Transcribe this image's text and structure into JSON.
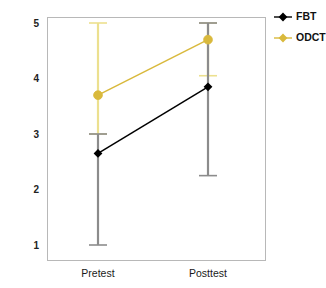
{
  "chart_data": {
    "type": "line",
    "title": "",
    "subtitle": "",
    "xlabel": "",
    "ylabel": "",
    "categories": [
      "Pretest",
      "Posttest"
    ],
    "x": [
      0,
      1
    ],
    "ylim": [
      1,
      5
    ],
    "yticks": [
      1,
      2,
      3,
      4,
      5
    ],
    "ytick_labels": [
      "1",
      "2",
      "3",
      "4",
      "5"
    ],
    "xtick_labels": [
      "Pretest",
      "Posttest"
    ],
    "grid": false,
    "legend_position": "right-top",
    "error_bars": true,
    "error_bar_style": "capped-range",
    "series": [
      {
        "name": "FBT",
        "color": "#000000",
        "marker": "diamond-filled",
        "values": [
          2.65,
          3.85
        ],
        "err_low": [
          1.0,
          2.25
        ],
        "err_high": [
          3.0,
          5.0
        ]
      },
      {
        "name": "ODCT",
        "color": "#d9b93c",
        "marker": "diamond-filled",
        "values": [
          3.7,
          4.7
        ],
        "err_low": [
          3.0,
          4.05
        ],
        "err_high": [
          5.0,
          5.0
        ]
      }
    ]
  },
  "legend": {
    "items": [
      {
        "label": "FBT",
        "color": "#000000"
      },
      {
        "label": "ODCT",
        "color": "#d9b93c"
      }
    ]
  },
  "axes": {
    "y_tick_labels": [
      "5",
      "4",
      "3",
      "2",
      "1"
    ],
    "x_tick_labels": [
      "Pretest",
      "Posttest"
    ]
  },
  "colors": {
    "series_fbt": "#000000",
    "series_odct": "#d9b93c",
    "errorbar_fbt": "#8c8c8c",
    "errorbar_odct": "#ece08f",
    "frame": "#b8b8b8",
    "background": "#ffffff"
  }
}
